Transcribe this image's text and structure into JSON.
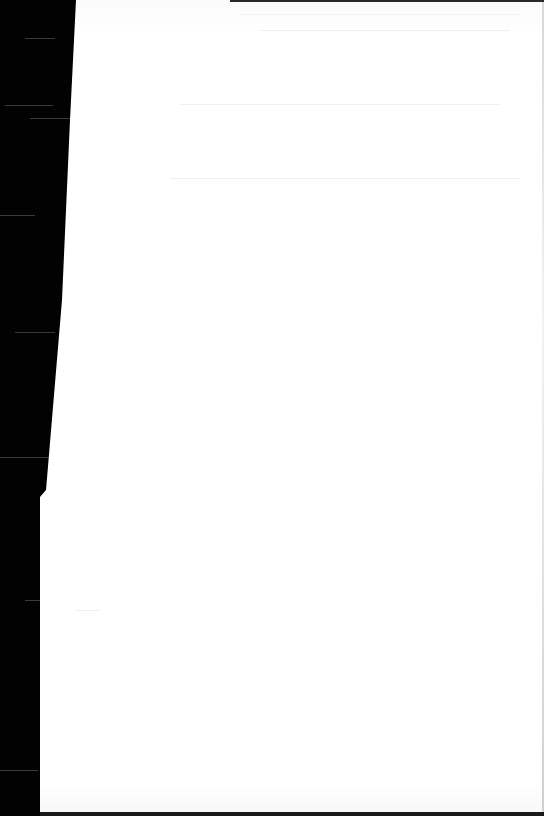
{
  "document": {
    "type": "photographed paper page",
    "state": "overexposed, no legible text",
    "visible_text": ""
  },
  "colors": {
    "background": "#000000",
    "page": "#ffffff",
    "faint_marks": "#eeeeee"
  }
}
